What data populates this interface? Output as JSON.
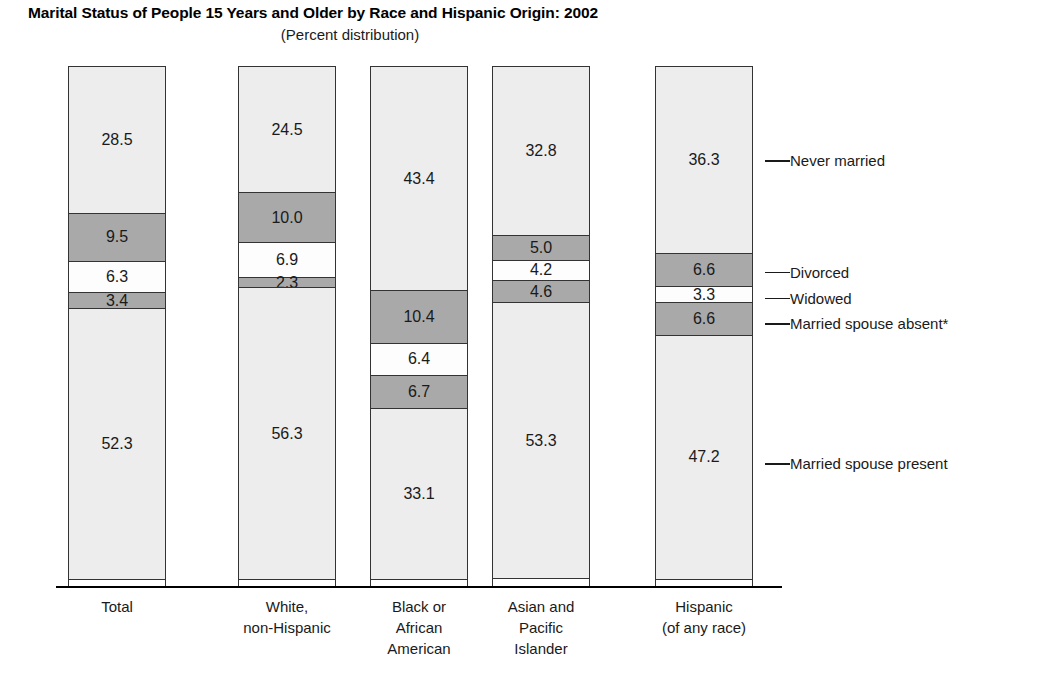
{
  "header": {
    "title": "Marital Status of People 15 Years and Older by Race and Hispanic Origin: 2002",
    "subtitle": "(Percent distribution)"
  },
  "colors": {
    "light_gray": "#ededed",
    "dark_gray": "#a9a9a9",
    "white": "#fdfdfd",
    "outline": "#333333",
    "text": "#1a1a1a"
  },
  "chart_data": {
    "type": "bar",
    "subtype": "stacked-percent",
    "title": "Marital Status of People 15 Years and Older by Race and Hispanic Origin: 2002",
    "subtitle": "(Percent distribution)",
    "xlabel": "",
    "ylabel": "",
    "ylim": [
      0,
      100
    ],
    "grid": false,
    "legend_position": "right",
    "categories": [
      "Total",
      "White, non-Hispanic",
      "Black or African American",
      "Asian and Pacific Islander",
      "Hispanic (of any race)"
    ],
    "category_label_lines": [
      [
        "Total"
      ],
      [
        "White,",
        "non-Hispanic"
      ],
      [
        "Black or",
        "African",
        "American"
      ],
      [
        "Asian and",
        "Pacific",
        "Islander"
      ],
      [
        "Hispanic",
        "(of any race)"
      ]
    ],
    "series": [
      {
        "name": "Never married",
        "fill": "light",
        "values": [
          28.5,
          24.5,
          43.4,
          32.8,
          36.3
        ]
      },
      {
        "name": "Divorced",
        "fill": "dark",
        "values": [
          9.5,
          10.0,
          10.4,
          5.0,
          6.6
        ]
      },
      {
        "name": "Widowed",
        "fill": "white",
        "values": [
          6.3,
          6.9,
          6.4,
          4.2,
          3.3
        ]
      },
      {
        "name": "Married spouse absent*",
        "fill": "dark",
        "values": [
          3.4,
          2.3,
          6.7,
          4.6,
          6.6
        ]
      },
      {
        "name": "Married spouse present",
        "fill": "light",
        "values": [
          52.3,
          56.3,
          33.1,
          53.3,
          47.2
        ]
      }
    ],
    "legend_entries": [
      "Never married",
      "Divorced",
      "Widowed",
      "Married spouse absent*",
      "Married spouse present"
    ],
    "value_labels": [
      [
        "28.5",
        "9.5",
        "6.3",
        "3.4",
        "52.3"
      ],
      [
        "24.5",
        "10.0",
        "6.9",
        "2.3",
        "56.3"
      ],
      [
        "43.4",
        "10.4",
        "6.4",
        "6.7",
        "33.1"
      ],
      [
        "32.8",
        "5.0",
        "4.2",
        "4.6",
        "53.3"
      ],
      [
        "36.3",
        "6.6",
        "3.3",
        "6.6",
        "47.2"
      ]
    ]
  },
  "layout": {
    "bar_x": [
      68,
      238,
      370,
      492,
      655
    ],
    "bar_width": 98,
    "plot_top": 66,
    "plot_bottom": 586,
    "legend_x": 790,
    "leader_start_x": 765
  }
}
